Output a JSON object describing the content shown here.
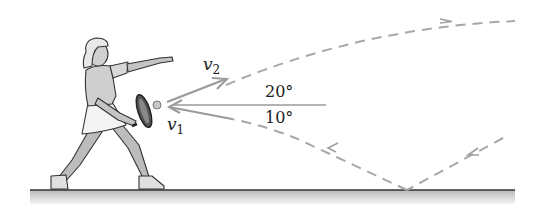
{
  "diagram": {
    "labels": {
      "v1": {
        "symbol": "v",
        "subscript": "1"
      },
      "v2": {
        "symbol": "v",
        "subscript": "2"
      },
      "angle_top": "20°",
      "angle_bottom": "10°"
    },
    "colors": {
      "trajectory": "#a8a8a8",
      "vector": "#9a9a9a",
      "reference_line": "#9a9a9a",
      "ground_line": "#333333",
      "ground_fill_top": "#bdbdbd",
      "ground_fill_bottom": "#f2f2f2",
      "figure_shade": "#c8c8c8",
      "text": "#222222"
    },
    "elements": [
      "tennis-player",
      "racket",
      "ball",
      "incoming-velocity-vector-v1",
      "outgoing-velocity-vector-v2",
      "horizontal-reference-line",
      "incoming-dashed-trajectory-with-bounce",
      "outgoing-dashed-trajectory",
      "ground"
    ]
  }
}
